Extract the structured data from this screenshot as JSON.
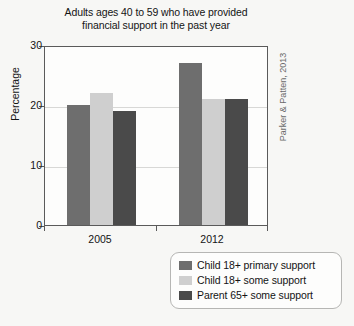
{
  "chart_data": {
    "type": "bar",
    "title": "Adults ages 40 to 59 who have provided financial support in the past year",
    "title_lines": [
      "Adults ages 40 to 59 who have provided",
      "financial support in the past year"
    ],
    "xlabel": "",
    "ylabel": "Percentage",
    "categories": [
      "2005",
      "2012"
    ],
    "ylim": [
      0,
      30
    ],
    "yticks": [
      0,
      10,
      20,
      30
    ],
    "ytick_labels": [
      "0",
      "10",
      "20",
      "30"
    ],
    "grid": true,
    "legend_position": "below-right",
    "series": [
      {
        "name": "Child 18+ primary support",
        "color": "#6e6e6e",
        "values": [
          20,
          27
        ]
      },
      {
        "name": "Child 18+ some support",
        "color": "#cfcfcf",
        "values": [
          22,
          21
        ]
      },
      {
        "name": "Parent 65+ some support",
        "color": "#4a4a4a",
        "values": [
          19,
          21
        ]
      }
    ],
    "annotation": "Parker & Patten, 2013"
  },
  "colors": {
    "background": "#f7f7f5",
    "plot_background": "#fdfdfc",
    "axis": "#5a5a5a",
    "gridline": "#d8d8d6",
    "text": "#141414",
    "annotation_text": "#6a6a6a",
    "legend_border": "#b6b6b4"
  }
}
